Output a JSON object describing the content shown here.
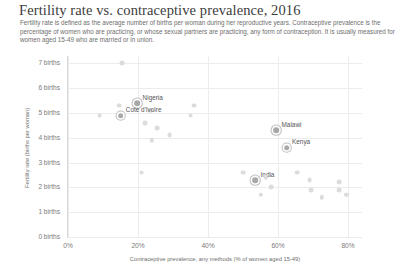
{
  "chart_data": {
    "type": "scatter",
    "title": "Fertility rate vs. contraceptive prevalence, 2016",
    "subtitle": "Fertility rate is defined as the average number of births per woman during her reproductive years. Contraceptive prevalence is the percentage of women who are practicing, or whose sexual partners are practicing, any form of contraception. It is usually measured for women aged 15-49 who are married or in union.",
    "xlabel": "Contraceptive prevalence, any methods (% of women aged 15-49)",
    "ylabel": "Fertility rate (births per woman)",
    "xlim": [
      0,
      84
    ],
    "ylim": [
      0,
      7.3
    ],
    "grid": true,
    "legend": "none",
    "xticks": [
      {
        "value": 0,
        "label": "0%"
      },
      {
        "value": 20,
        "label": "20%"
      },
      {
        "value": 40,
        "label": "40%"
      },
      {
        "value": 60,
        "label": "60%"
      },
      {
        "value": 80,
        "label": "80%"
      }
    ],
    "yticks": [
      {
        "value": 0,
        "label": "0 births"
      },
      {
        "value": 1,
        "label": "1 births"
      },
      {
        "value": 2,
        "label": "2 births"
      },
      {
        "value": 3,
        "label": "3 births"
      },
      {
        "value": 4,
        "label": "4 births"
      },
      {
        "value": 5,
        "label": "5 births"
      },
      {
        "value": 6,
        "label": "6 births"
      },
      {
        "value": 7,
        "label": "7 births"
      }
    ],
    "marker_color": "#dcdcdc",
    "highlight_color": "#a8a8a8",
    "points": [
      {
        "x": 15.5,
        "y": 7.0,
        "label": "",
        "highlight": false,
        "r": 2.4
      },
      {
        "x": 14.5,
        "y": 5.3,
        "label": "",
        "highlight": false,
        "r": 2.4
      },
      {
        "x": 19.8,
        "y": 5.4,
        "label": "Nigeria",
        "highlight": true,
        "r": 2.8
      },
      {
        "x": 23.5,
        "y": 5.1,
        "label": "",
        "highlight": false,
        "r": 2.2
      },
      {
        "x": 15.0,
        "y": 4.9,
        "label": "Cote d'Ivoire",
        "highlight": true,
        "r": 2.8
      },
      {
        "x": 9.0,
        "y": 4.9,
        "label": "",
        "highlight": false,
        "r": 2.4
      },
      {
        "x": 22.0,
        "y": 4.6,
        "label": "",
        "highlight": false,
        "r": 2.4
      },
      {
        "x": 25.5,
        "y": 4.4,
        "label": "",
        "highlight": false,
        "r": 2.4
      },
      {
        "x": 24.0,
        "y": 3.9,
        "label": "",
        "highlight": false,
        "r": 2.2
      },
      {
        "x": 29.0,
        "y": 4.1,
        "label": "",
        "highlight": false,
        "r": 2.4
      },
      {
        "x": 36.0,
        "y": 5.3,
        "label": "",
        "highlight": false,
        "r": 2.4
      },
      {
        "x": 35.0,
        "y": 4.9,
        "label": "",
        "highlight": false,
        "r": 2.4
      },
      {
        "x": 21.0,
        "y": 2.6,
        "label": "",
        "highlight": false,
        "r": 2.4
      },
      {
        "x": 59.5,
        "y": 4.3,
        "label": "Malawi",
        "highlight": true,
        "r": 2.8
      },
      {
        "x": 62.5,
        "y": 3.6,
        "label": "Kenya",
        "highlight": true,
        "r": 2.8
      },
      {
        "x": 50.0,
        "y": 2.6,
        "label": "",
        "highlight": false,
        "r": 2.4
      },
      {
        "x": 53.5,
        "y": 2.3,
        "label": "India",
        "highlight": true,
        "r": 2.8
      },
      {
        "x": 56.5,
        "y": 2.4,
        "label": "",
        "highlight": false,
        "r": 2.2
      },
      {
        "x": 58.0,
        "y": 2.0,
        "label": "",
        "highlight": false,
        "r": 2.4
      },
      {
        "x": 55.0,
        "y": 1.7,
        "label": "",
        "highlight": false,
        "r": 2.2
      },
      {
        "x": 65.5,
        "y": 2.6,
        "label": "",
        "highlight": false,
        "r": 2.4
      },
      {
        "x": 69.0,
        "y": 2.3,
        "label": "",
        "highlight": false,
        "r": 2.4
      },
      {
        "x": 69.5,
        "y": 1.9,
        "label": "",
        "highlight": false,
        "r": 2.4
      },
      {
        "x": 72.5,
        "y": 1.6,
        "label": "",
        "highlight": false,
        "r": 2.2
      },
      {
        "x": 77.5,
        "y": 2.2,
        "label": "",
        "highlight": false,
        "r": 2.4
      },
      {
        "x": 77.5,
        "y": 1.9,
        "label": "",
        "highlight": false,
        "r": 2.4
      },
      {
        "x": 79.5,
        "y": 1.7,
        "label": "",
        "highlight": false,
        "r": 2.2
      }
    ]
  }
}
